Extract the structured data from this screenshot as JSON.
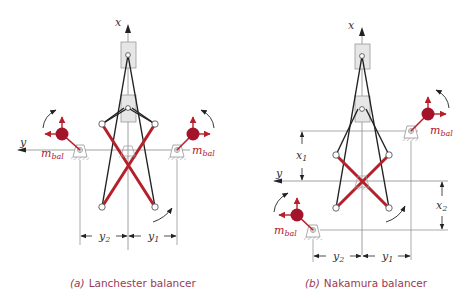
{
  "colors": {
    "red": "#b5202b",
    "dark_red": "#a3142a",
    "line": "#222222",
    "thin": "#888888",
    "box_fill": "#e6e6e6",
    "box_stroke": "#9a9a9a",
    "caption": "#9a3a55"
  },
  "panels": [
    {
      "id": "a",
      "caption_letter": "(a)",
      "caption_text": "Lanchester balancer",
      "axis_x_label": "x",
      "axis_y_label": "y",
      "mass_label_left": "m",
      "mass_label_left_sub": "bal",
      "mass_label_right": "m",
      "mass_label_right_sub": "bal",
      "dim_y2": "y",
      "dim_y2_sub": "2",
      "dim_y1": "y",
      "dim_y1_sub": "1"
    },
    {
      "id": "b",
      "caption_letter": "(b)",
      "caption_text": "Nakamura balancer",
      "axis_x_label": "x",
      "axis_y_label": "y",
      "mass_label_upper": "m",
      "mass_label_upper_sub": "bal",
      "mass_label_lower": "m",
      "mass_label_lower_sub": "bal",
      "dim_x1": "x",
      "dim_x1_sub": "1",
      "dim_x2": "x",
      "dim_x2_sub": "2",
      "dim_y2": "y",
      "dim_y2_sub": "2",
      "dim_y1": "y",
      "dim_y1_sub": "1"
    }
  ]
}
